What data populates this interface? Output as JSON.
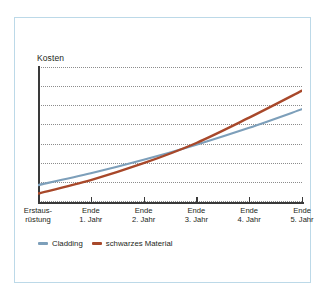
{
  "figure": {
    "frame_color": "#bcd9e8",
    "background": "#ffffff"
  },
  "chart_data": {
    "type": "line",
    "title": "",
    "subtitle": "",
    "xlabel": "",
    "ylabel": "Kosten",
    "grid": true,
    "gridlines": 8,
    "legend_position": "bottom-left",
    "categories": [
      "Erstausrüstung",
      "Ende 1. Jahr",
      "Ende 2. Jahr",
      "Ende 3. Jahr",
      "Ende 4. Jahr",
      "Ende 5. Jahr"
    ],
    "x": [
      0,
      1,
      2,
      3,
      4,
      5
    ],
    "xlim": [
      0,
      5
    ],
    "ylim": [
      0,
      8
    ],
    "series": [
      {
        "name": "Cladding",
        "color": "#7d9fba",
        "values": [
          1.0,
          1.7,
          2.5,
          3.4,
          4.4,
          5.5
        ]
      },
      {
        "name": "schwarzes Material",
        "color": "#a8482a",
        "values": [
          0.5,
          1.3,
          2.3,
          3.5,
          5.0,
          6.6
        ]
      }
    ]
  },
  "axes": {
    "ylabel": "Kosten",
    "xticklabels": [
      {
        "line1": "Erstaus-",
        "line2": "rüstung"
      },
      {
        "line1": "Ende",
        "line2": "1. Jahr"
      },
      {
        "line1": "Ende",
        "line2": "2. Jahr"
      },
      {
        "line1": "Ende",
        "line2": "3. Jahr"
      },
      {
        "line1": "Ende",
        "line2": "4. Jahr"
      },
      {
        "line1": "Ende",
        "line2": "5. Jahr"
      }
    ]
  },
  "legend": {
    "items": [
      {
        "label": "Cladding",
        "color": "#7d9fba"
      },
      {
        "label": "schwarzes Material",
        "color": "#a8482a"
      }
    ]
  }
}
